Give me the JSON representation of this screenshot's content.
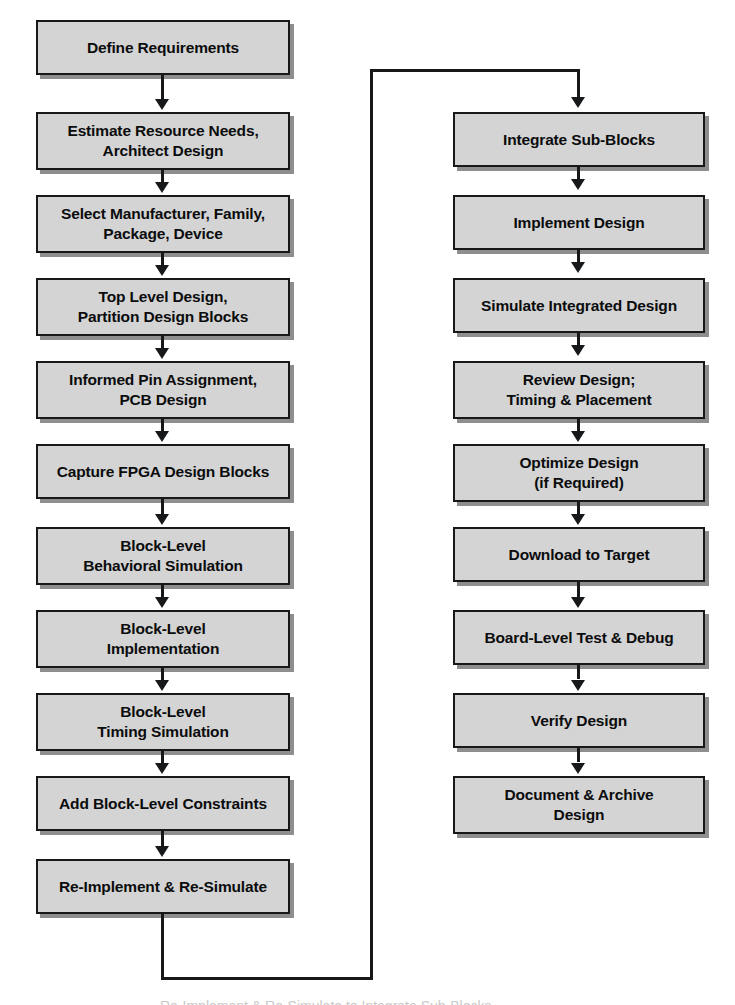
{
  "diagram": {
    "colors": {
      "box_fill": "#d4d4d4",
      "box_border": "#17181a",
      "box_shadow": "#8e8e8e",
      "connector": "#17181a",
      "background": "#ffffff"
    },
    "left_column": [
      {
        "id": "define-requirements",
        "label": "Define Requirements"
      },
      {
        "id": "estimate-resource-needs",
        "label": "Estimate Resource Needs,\nArchitect Design"
      },
      {
        "id": "select-manufacturer",
        "label": "Select Manufacturer, Family,\nPackage, Device"
      },
      {
        "id": "top-level-design",
        "label": "Top Level Design,\nPartition Design Blocks"
      },
      {
        "id": "informed-pin-assignment",
        "label": "Informed Pin Assignment,\nPCB Design"
      },
      {
        "id": "capture-fpga-design-blocks",
        "label": "Capture FPGA Design Blocks"
      },
      {
        "id": "block-level-behavioral-sim",
        "label": "Block-Level\nBehavioral Simulation"
      },
      {
        "id": "block-level-implementation",
        "label": "Block-Level\nImplementation"
      },
      {
        "id": "block-level-timing-sim",
        "label": "Block-Level\nTiming Simulation"
      },
      {
        "id": "add-block-level-constraints",
        "label": "Add Block-Level Constraints"
      },
      {
        "id": "re-implement-re-simulate",
        "label": "Re-Implement & Re-Simulate"
      }
    ],
    "right_column": [
      {
        "id": "integrate-sub-blocks",
        "label": "Integrate Sub-Blocks"
      },
      {
        "id": "implement-design",
        "label": "Implement Design"
      },
      {
        "id": "simulate-integrated-design",
        "label": "Simulate Integrated Design"
      },
      {
        "id": "review-design",
        "label": "Review Design;\nTiming & Placement"
      },
      {
        "id": "optimize-design",
        "label": "Optimize Design\n(if Required)"
      },
      {
        "id": "download-to-target",
        "label": "Download to Target"
      },
      {
        "id": "board-level-test-debug",
        "label": "Board-Level Test & Debug"
      },
      {
        "id": "verify-design",
        "label": "Verify Design"
      },
      {
        "id": "document-archive-design",
        "label": "Document & Archive\nDesign"
      }
    ],
    "feedback_loop": {
      "label": "Re-Implement & Re-Simulate to Integrate Sub-Blocks"
    }
  }
}
